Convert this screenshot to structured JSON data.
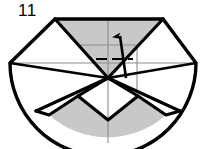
{
  "figure": {
    "step_number": "11",
    "type": "origami-folding-diagram",
    "colors": {
      "ink": "#000000",
      "shade_fill": "#c8c8c8",
      "paper_white": "#ffffff",
      "thin_crease": "#8c8c8c",
      "background": "#ffffff"
    },
    "geometry": {
      "canvas_width": 205,
      "canvas_height": 149,
      "center_point": [
        108,
        78
      ],
      "top_left_vertex": [
        55,
        19
      ],
      "top_right_vertex": [
        163,
        19
      ],
      "left_vertex": [
        10,
        63
      ],
      "right_vertex": [
        196,
        63
      ],
      "bottom_arc_low_point": [
        108,
        143
      ],
      "horizontal_axis_y": 63,
      "vertical_axis_x": 108
    },
    "elements": {
      "outline_label": "model-outline",
      "top_shaded_label": "top-shaded-triangle",
      "bottom_shaded_label": "bottom-shaded-region",
      "arrow_label": "fold-arrow",
      "arrow_direction": "up",
      "crease_label": "crease-line",
      "axis_label": "center-axis-line"
    }
  }
}
